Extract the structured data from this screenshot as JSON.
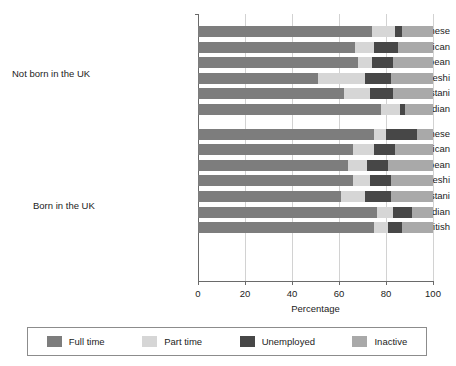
{
  "chart_data": {
    "type": "bar",
    "orientation": "horizontal",
    "stacked": true,
    "title": "",
    "xlabel": "Percentage",
    "ylabel": "",
    "xlim": [
      0,
      100
    ],
    "xticks": [
      0,
      20,
      40,
      60,
      80,
      100
    ],
    "grid": true,
    "legend_position": "bottom",
    "legend": [
      "Full time",
      "Part time",
      "Unemployed",
      "Inactive"
    ],
    "series_colors": [
      "#7d7d7d",
      "#d6d6d6",
      "#474747",
      "#a9a9a9"
    ],
    "groups": [
      {
        "label": "Not born in the UK",
        "categories": [
          "Chinese",
          "Black African",
          "Black Caribbean",
          "Bangladeshi",
          "Pakistani",
          "Indian"
        ],
        "rows": [
          {
            "category": "Chinese",
            "Full time": 74,
            "Part time": 10,
            "Unemployed": 3,
            "Inactive": 13
          },
          {
            "category": "Black African",
            "Full time": 67,
            "Part time": 8,
            "Unemployed": 10,
            "Inactive": 15
          },
          {
            "category": "Black Caribbean",
            "Full time": 68,
            "Part time": 6,
            "Unemployed": 9,
            "Inactive": 17
          },
          {
            "category": "Bangladeshi",
            "Full time": 51,
            "Part time": 20,
            "Unemployed": 11,
            "Inactive": 18
          },
          {
            "category": "Pakistani",
            "Full time": 62,
            "Part time": 11,
            "Unemployed": 10,
            "Inactive": 17
          },
          {
            "category": "Indian",
            "Full time": 78,
            "Part time": 8,
            "Unemployed": 2,
            "Inactive": 12
          }
        ]
      },
      {
        "label": "Born in the UK",
        "categories": [
          "Chinese",
          "Black African",
          "Black Caribbean",
          "Bangladeshi",
          "Pakistani",
          "Indian",
          "White British"
        ],
        "rows": [
          {
            "category": "Chinese",
            "Full time": 75,
            "Part time": 5,
            "Unemployed": 13,
            "Inactive": 7
          },
          {
            "category": "Black African",
            "Full time": 66,
            "Part time": 9,
            "Unemployed": 9,
            "Inactive": 16
          },
          {
            "category": "Black Caribbean",
            "Full time": 64,
            "Part time": 8,
            "Unemployed": 9,
            "Inactive": 19
          },
          {
            "category": "Bangladeshi",
            "Full time": 66,
            "Part time": 7,
            "Unemployed": 9,
            "Inactive": 18
          },
          {
            "category": "Pakistani",
            "Full time": 61,
            "Part time": 10,
            "Unemployed": 11,
            "Inactive": 18
          },
          {
            "category": "Indian",
            "Full time": 76,
            "Part time": 7,
            "Unemployed": 8,
            "Inactive": 9
          },
          {
            "category": "White British",
            "Full time": 75,
            "Part time": 6,
            "Unemployed": 6,
            "Inactive": 13
          }
        ]
      }
    ]
  },
  "axis": {
    "x_title": "Percentage",
    "tick_labels": [
      "0",
      "20",
      "40",
      "60",
      "80",
      "100"
    ]
  },
  "legend": {
    "items": [
      {
        "label": "Full time",
        "color": "#7d7d7d"
      },
      {
        "label": "Part time",
        "color": "#d6d6d6"
      },
      {
        "label": "Unemployed",
        "color": "#474747"
      },
      {
        "label": "Inactive",
        "color": "#a9a9a9"
      }
    ]
  },
  "group_labels": {
    "not_born": "Not born in the UK",
    "born": "Born in the UK"
  }
}
